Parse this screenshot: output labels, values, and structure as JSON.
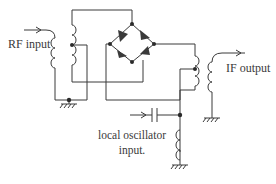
{
  "diagram": {
    "type": "circuit-schematic",
    "labels": {
      "rf_input": "RF input",
      "if_output": "IF output",
      "lo_line1": "local oscillator",
      "lo_line2": "input."
    },
    "components": [
      {
        "id": "T1",
        "kind": "transformer",
        "role": "RF input transformer, center-tapped secondary"
      },
      {
        "id": "D1-D4",
        "kind": "diode-ring",
        "count": 4
      },
      {
        "id": "T2",
        "kind": "transformer",
        "role": "IF output transformer, center-tapped primary"
      },
      {
        "id": "C1",
        "kind": "capacitor",
        "role": "LO coupling capacitor"
      },
      {
        "id": "L1",
        "kind": "inductor",
        "role": "LO choke to ground"
      },
      {
        "id": "GND",
        "kind": "ground",
        "count": 4
      }
    ],
    "colors": {
      "line": "#3a3a3a",
      "background": "#ffffff"
    }
  }
}
